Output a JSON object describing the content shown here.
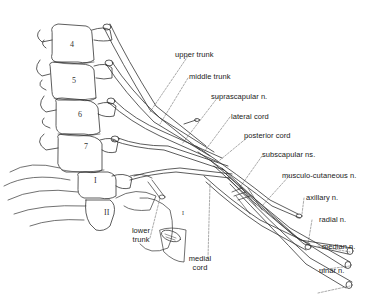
{
  "diagram": {
    "vertebrae": [
      {
        "id": "c4",
        "label": "4"
      },
      {
        "id": "c5",
        "label": "5"
      },
      {
        "id": "c6",
        "label": "6"
      },
      {
        "id": "c7",
        "label": "7"
      },
      {
        "id": "t1",
        "label": "I"
      },
      {
        "id": "t2",
        "label": "II"
      }
    ],
    "rib_label": "I",
    "labels": {
      "upper_trunk": "upper trunk",
      "middle_trunk": "middle trunk",
      "suprascapular": "suprascapular n.",
      "lateral_cord": "lateral cord",
      "posterior_cord": "posterior cord",
      "subscapular": "subscapular ns.",
      "musculocutaneous": "musculo-cutaneous n.",
      "axillary": "axillary n.",
      "radial": "radial n.",
      "median": "median n.",
      "ulnar": "ulnar n.",
      "lower_trunk_1": "lower",
      "lower_trunk_2": "trunk",
      "medial_cord_1": "medial",
      "medial_cord_2": "cord"
    },
    "colors": {
      "line": "#333333",
      "leader": "#555555",
      "background": "#ffffff"
    }
  }
}
